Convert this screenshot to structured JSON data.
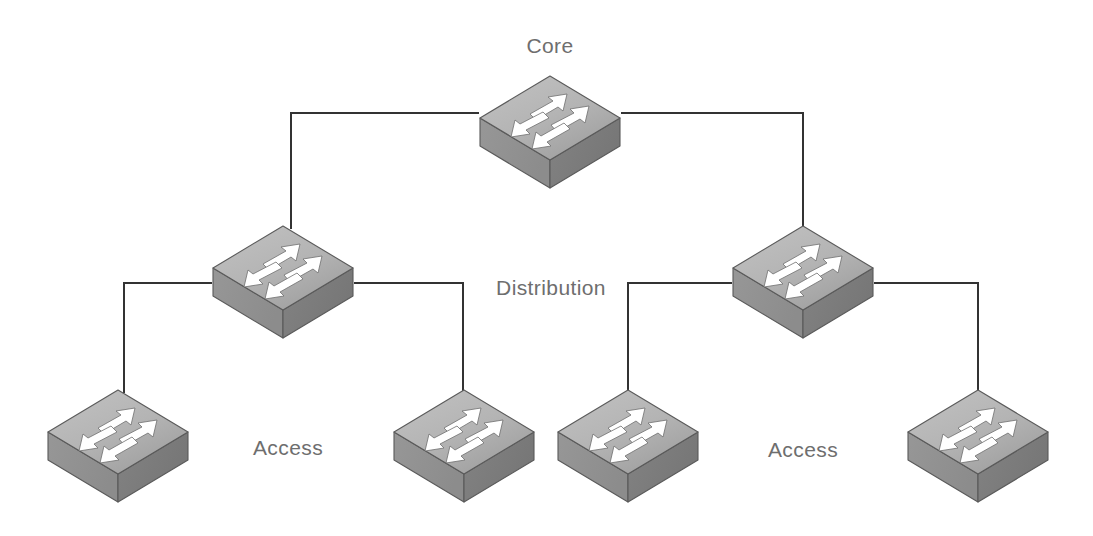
{
  "diagram": {
    "type": "network-topology",
    "background_color": "#ffffff",
    "link_color": "#333333",
    "label_color": "#6e6e6e",
    "device_colors": {
      "top_face": "#b4b4b4",
      "top_face_dark": "#9e9e9e",
      "left_face": "#8c8c8c",
      "right_face": "#767676",
      "outline": "#5a5a5a",
      "arrow": "#ffffff"
    }
  },
  "labels": [
    {
      "id": "label-core",
      "text": "Core",
      "x": 550,
      "y": 34
    },
    {
      "id": "label-distribution",
      "text": "Distribution",
      "x": 551,
      "y": 276
    },
    {
      "id": "label-access-left",
      "text": "Access",
      "x": 288,
      "y": 436
    },
    {
      "id": "label-access-right",
      "text": "Access",
      "x": 803,
      "y": 438
    }
  ],
  "nodes": [
    {
      "id": "core-1",
      "name": "core-switch",
      "tier": "Core",
      "x": 478,
      "y": 72,
      "w": 144,
      "h": 118
    },
    {
      "id": "dist-1",
      "name": "distribution-switch-left",
      "tier": "Distribution",
      "x": 211,
      "y": 222,
      "w": 144,
      "h": 118
    },
    {
      "id": "dist-2",
      "name": "distribution-switch-right",
      "tier": "Distribution",
      "x": 731,
      "y": 222,
      "w": 144,
      "h": 118
    },
    {
      "id": "acc-1",
      "name": "access-switch-1",
      "tier": "Access",
      "x": 46,
      "y": 386,
      "w": 144,
      "h": 118
    },
    {
      "id": "acc-2",
      "name": "access-switch-2",
      "tier": "Access",
      "x": 392,
      "y": 386,
      "w": 144,
      "h": 118
    },
    {
      "id": "acc-3",
      "name": "access-switch-3",
      "tier": "Access",
      "x": 556,
      "y": 386,
      "w": 144,
      "h": 118
    },
    {
      "id": "acc-4",
      "name": "access-switch-4",
      "tier": "Access",
      "x": 906,
      "y": 386,
      "w": 144,
      "h": 118
    }
  ],
  "links": [
    {
      "id": "link-core-dist1",
      "name": "link-core-to-distribution-left",
      "from": "core-1",
      "to": "dist-1",
      "path": "M 478 113 L 291 113 L 291 228"
    },
    {
      "id": "link-core-dist2",
      "name": "link-core-to-distribution-right",
      "from": "core-1",
      "to": "dist-2",
      "path": "M 622 113 L 803 113 L 803 228"
    },
    {
      "id": "link-dist1-acc1",
      "name": "link-distribution-left-to-access-1",
      "from": "dist-1",
      "to": "acc-1",
      "path": "M 211 283 L 124 283 L 124 392"
    },
    {
      "id": "link-dist1-acc2",
      "name": "link-distribution-left-to-access-2",
      "from": "dist-1",
      "to": "acc-2",
      "path": "M 355 283 L 463 283 L 463 392"
    },
    {
      "id": "link-dist2-acc3",
      "name": "link-distribution-right-to-access-3",
      "from": "dist-2",
      "to": "acc-3",
      "path": "M 731 283 L 628 283 L 628 392"
    },
    {
      "id": "link-dist2-acc4",
      "name": "link-distribution-right-to-access-4",
      "from": "dist-2",
      "to": "acc-4",
      "path": "M 875 283 L 978 283 L 978 392"
    }
  ]
}
